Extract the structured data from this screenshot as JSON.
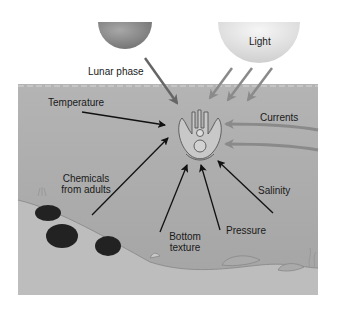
{
  "diagram": {
    "colors": {
      "water": "#a9a9a9",
      "seafloor": "#bdbdbd",
      "moon": "#8c8c8c",
      "sun": "#e4e4e4",
      "black_arrow": "#111111",
      "grey_arrow": "#8a8a8a"
    },
    "labels": {
      "lunar_phase": "Lunar phase",
      "light": "Light",
      "temperature": "Temperature",
      "currents": "Currents",
      "chemicals_line1": "Chemicals",
      "chemicals_line2": "from adults",
      "salinity": "Salinity",
      "bottom_line1": "Bottom",
      "bottom_line2": "texture",
      "pressure": "Pressure"
    },
    "center_object": "larva",
    "icons": [
      "moon-icon",
      "sun-icon",
      "larva-icon",
      "sea-urchin-icon",
      "rock-icon",
      "seaweed-icon"
    ]
  }
}
